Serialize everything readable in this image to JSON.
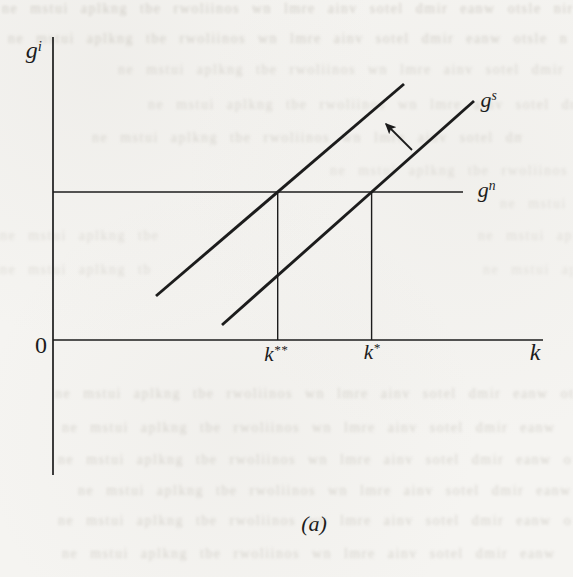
{
  "figure": {
    "type": "scanned-book-figure",
    "panel_label": "(a)",
    "labels": {
      "gi": {
        "base": "g",
        "sup": "i"
      },
      "gs": {
        "base": "g",
        "sup": "s"
      },
      "gn": {
        "base": "g",
        "sup": "n"
      },
      "k_double_star": {
        "base": "k",
        "sup": "**"
      },
      "k_star": {
        "base": "k",
        "sup": "*"
      },
      "k": {
        "base": "k",
        "sup": ""
      },
      "origin": "0"
    }
  },
  "chart_data": {
    "type": "line",
    "title": "",
    "xlabel": "k",
    "ylabel": "g^i",
    "panel": "(a)",
    "xlim": [
      0,
      1
    ],
    "ylim": [
      0,
      1
    ],
    "grid": false,
    "axes_note": "qualitative growth diagram; no numeric tick values shown",
    "series": [
      {
        "name": "g^s (initial schedule)",
        "x": [
          0.345,
          0.859
        ],
        "y": [
          0.05,
          0.789
        ]
      },
      {
        "name": "g^s (shifted up schedule)",
        "x": [
          0.21,
          0.716
        ],
        "y": [
          0.145,
          0.845
        ]
      },
      {
        "name": "g^n (horizontal line)",
        "x": [
          0.0,
          0.837
        ],
        "y": [
          0.488,
          0.488
        ]
      }
    ],
    "reference_lines": [
      {
        "label": "k**",
        "x": 0.459,
        "from_y": 0.0,
        "to_y": 0.488
      },
      {
        "label": "k*",
        "x": 0.65,
        "from_y": 0.0,
        "to_y": 0.488
      }
    ],
    "annotations": [
      {
        "type": "arrow",
        "meaning": "upward shift of g^s schedule",
        "from": [
          0.733,
          0.627
        ],
        "to": [
          0.673,
          0.723
        ]
      }
    ],
    "x_axis_markers": [
      "0",
      "k**",
      "k*"
    ],
    "legend": "none"
  },
  "colors": {
    "paper": "#f5f4f1",
    "ink": "#1c1c1c",
    "bleed": "#cfccc5"
  },
  "bleedthrough": {
    "note": "illegible mirrored ink bleed-through from reverse page of the scanned book",
    "glyphs": "ne mstui aplkng tbe rwoliinos wn lmre ainv sotel dmir eanw otsle nirm aewo tslne rim oanew slet nima rowe tesln",
    "rows": [
      {
        "top": 1,
        "left": 2,
        "width": 571,
        "opacity": 0.95
      },
      {
        "top": 31,
        "left": 8,
        "width": 560,
        "opacity": 0.9
      },
      {
        "top": 62,
        "left": 118,
        "width": 455,
        "opacity": 0.75
      },
      {
        "top": 97,
        "left": 148,
        "width": 425,
        "opacity": 0.7
      },
      {
        "top": 130,
        "left": 92,
        "width": 430,
        "opacity": 0.75
      },
      {
        "top": 163,
        "left": 330,
        "width": 243,
        "opacity": 0.6
      },
      {
        "top": 196,
        "left": 500,
        "width": 73,
        "opacity": 0.55
      },
      {
        "top": 228,
        "left": 0,
        "width": 165,
        "opacity": 0.6
      },
      {
        "top": 228,
        "left": 478,
        "width": 95,
        "opacity": 0.55
      },
      {
        "top": 262,
        "left": 0,
        "width": 150,
        "opacity": 0.6
      },
      {
        "top": 262,
        "left": 483,
        "width": 90,
        "opacity": 0.5
      },
      {
        "top": 386,
        "left": 55,
        "width": 518,
        "opacity": 0.8
      },
      {
        "top": 420,
        "left": 62,
        "width": 505,
        "opacity": 0.8
      },
      {
        "top": 452,
        "left": 58,
        "width": 515,
        "opacity": 0.8
      },
      {
        "top": 483,
        "left": 78,
        "width": 495,
        "opacity": 0.8
      },
      {
        "top": 513,
        "left": 58,
        "width": 515,
        "opacity": 0.8
      },
      {
        "top": 546,
        "left": 62,
        "width": 505,
        "opacity": 0.8
      }
    ]
  }
}
